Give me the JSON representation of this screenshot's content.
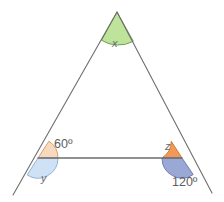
{
  "figure": {
    "type": "geometry-diagram",
    "background_color": "#ffffff",
    "stroke_color": "#6e6e6e",
    "labels": {
      "apex_angle": "x",
      "left_exterior_angle": "y",
      "right_interior_angle": "z",
      "left_interior_angle": "60º",
      "right_exterior_angle": "120º"
    },
    "angles": [
      {
        "name": "x",
        "vertex": "apex",
        "fill_color": "#bde49a",
        "stroke_color": "#6f9e52",
        "position": {
          "x": 117,
          "y": 12
        }
      },
      {
        "name": "60º",
        "vertex": "bottom-left-interior",
        "fill_color": "#f7d9bd",
        "stroke_color": "#d9a06a",
        "position": {
          "x": 38,
          "y": 158
        }
      },
      {
        "name": "y",
        "vertex": "bottom-left-exterior",
        "fill_color": "#cfe2f5",
        "stroke_color": "#8fb4d8",
        "position": {
          "x": 38,
          "y": 158
        }
      },
      {
        "name": "z",
        "vertex": "bottom-right-interior",
        "fill_color": "#f29a55",
        "stroke_color": "#cf7a37",
        "position": {
          "x": 182,
          "y": 158
        }
      },
      {
        "name": "120º",
        "vertex": "bottom-right-exterior",
        "fill_color": "#9aa8d6",
        "stroke_color": "#6f7fb5",
        "position": {
          "x": 182,
          "y": 158
        }
      }
    ],
    "vertices": {
      "apex": {
        "x": 117,
        "y": 12
      },
      "bottom_left": {
        "x": 38,
        "y": 158
      },
      "bottom_right": {
        "x": 182,
        "y": 158
      },
      "left_extension_end": {
        "x": 13,
        "y": 195
      },
      "right_extension_end": {
        "x": 212,
        "y": 193
      }
    }
  }
}
